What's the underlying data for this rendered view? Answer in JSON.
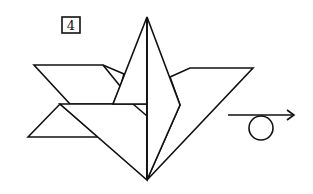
{
  "diagram": {
    "type": "origami-instruction",
    "step_number": "4",
    "colors": {
      "line": "#111111",
      "paper": "#ffffff"
    },
    "symbols": [
      {
        "name": "turn-over-arrow",
        "description": "Arrow with loop indicating turn the model over"
      }
    ]
  }
}
